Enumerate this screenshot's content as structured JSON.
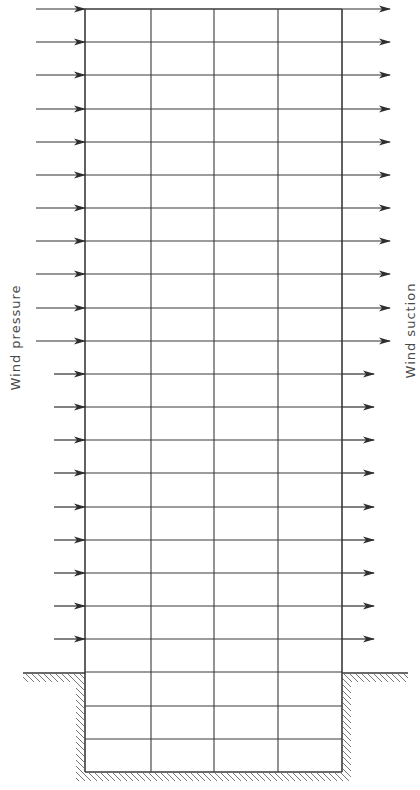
{
  "diagram": {
    "labels": {
      "left": "Wind pressure",
      "right": "Wind suction"
    },
    "colors": {
      "line": "#3a3a3a",
      "arrow": "#2e2e2e",
      "hatch": "#777777",
      "text": "#4a4a4a"
    },
    "structure": {
      "columns_x": [
        85,
        151,
        214,
        278,
        342
      ],
      "top_y": 9,
      "ground_y": 673,
      "bottom_y": 772,
      "row_spacing": 33.15,
      "rows_above_ground": 20,
      "rows_below_ground": 3
    },
    "wind_pressure_arrows": {
      "count": 20,
      "upper_start_x": 36,
      "lower_start_x": 54,
      "split_after_row": 11,
      "end_x": 85
    },
    "wind_suction_arrows": {
      "count": 20,
      "start_x": 342,
      "upper_end_x": 390,
      "lower_end_x": 374,
      "split_after_row": 11
    },
    "ground": {
      "left_from_x": 23,
      "right_to_x": 408
    }
  }
}
